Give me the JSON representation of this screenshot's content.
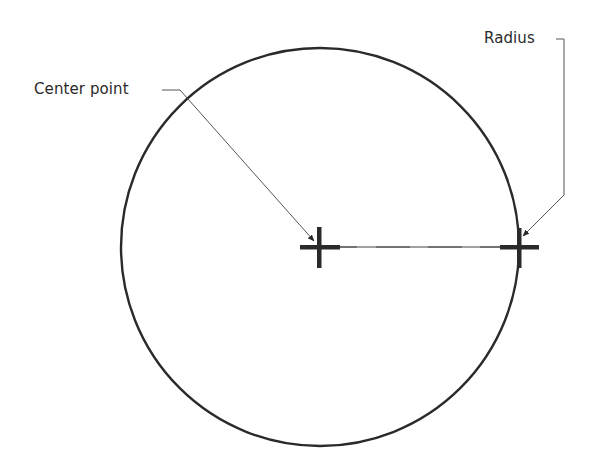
{
  "diagram": {
    "title": "",
    "labels": {
      "center_point": "Center point",
      "radius": "Radius"
    },
    "colors": {
      "stroke": "#2a2a2a",
      "leader": "#555555",
      "background": "#ffffff"
    },
    "geometry": {
      "circle": {
        "cx": 320,
        "cy": 247,
        "r": 199
      },
      "center_mark": {
        "x": 319,
        "y": 247
      },
      "radius_mark": {
        "x": 519,
        "y": 247
      }
    },
    "elements": [
      "circle",
      "center-cross-mark",
      "radius-cross-mark",
      "dashed-radius-line",
      "center-point-leader-arrow",
      "radius-leader-arrow"
    ]
  }
}
